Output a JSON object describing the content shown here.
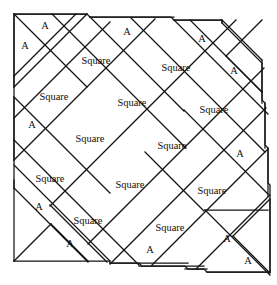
{
  "figure": {
    "name": "square-tiling-dissection",
    "background_color": "#ffffff",
    "line_color": "#141414",
    "text_color": "#0f0f0f",
    "width": 277,
    "height": 285,
    "labels": {
      "square": "Square",
      "triangle": "A"
    }
  },
  "tiles": {
    "squares": [
      {
        "id": "sq-r0-c1",
        "label": "Square",
        "cx": 96,
        "cy": 62
      },
      {
        "id": "sq-r0-c2",
        "label": "Square",
        "cx": 176,
        "cy": 69
      },
      {
        "id": "sq-r1-c0",
        "label": "Square",
        "cx": 54,
        "cy": 98
      },
      {
        "id": "sq-r1-c1",
        "label": "Square",
        "cx": 132,
        "cy": 104
      },
      {
        "id": "sq-r1-c2",
        "label": "Square",
        "cx": 214,
        "cy": 111
      },
      {
        "id": "sq-r2-c0",
        "label": "Square",
        "cx": 90,
        "cy": 140
      },
      {
        "id": "sq-r2-c1",
        "label": "Square",
        "cx": 172,
        "cy": 147
      },
      {
        "id": "sq-r3-c0",
        "label": "Square",
        "cx": 50,
        "cy": 180
      },
      {
        "id": "sq-r3-c1",
        "label": "Square",
        "cx": 130,
        "cy": 186
      },
      {
        "id": "sq-r3-c2",
        "label": "Square",
        "cx": 212,
        "cy": 192
      },
      {
        "id": "sq-r4-c0",
        "label": "Square",
        "cx": 88,
        "cy": 222
      },
      {
        "id": "sq-r4-c1",
        "label": "Square",
        "cx": 170,
        "cy": 229
      }
    ],
    "triangles": [
      {
        "id": "tri-tl-upper",
        "label": "A",
        "cx": 45,
        "cy": 27
      },
      {
        "id": "tri-tl-left",
        "label": "A",
        "cx": 25,
        "cy": 47
      },
      {
        "id": "tri-top-mid",
        "label": "A",
        "cx": 127,
        "cy": 33
      },
      {
        "id": "tri-tr-upper",
        "label": "A",
        "cx": 202,
        "cy": 40
      },
      {
        "id": "tri-tr-right",
        "label": "A",
        "cx": 234,
        "cy": 72
      },
      {
        "id": "tri-left-1",
        "label": "A",
        "cx": 32,
        "cy": 126
      },
      {
        "id": "tri-right-1",
        "label": "A",
        "cx": 240,
        "cy": 155
      },
      {
        "id": "tri-left-2",
        "label": "A",
        "cx": 39,
        "cy": 208
      },
      {
        "id": "tri-bot-1",
        "label": "A",
        "cx": 70,
        "cy": 245
      },
      {
        "id": "tri-bot-2",
        "label": "A",
        "cx": 150,
        "cy": 251
      },
      {
        "id": "tri-br-lower",
        "label": "A",
        "cx": 227,
        "cy": 240
      },
      {
        "id": "tri-br-right",
        "label": "A",
        "cx": 248,
        "cy": 262
      }
    ]
  }
}
